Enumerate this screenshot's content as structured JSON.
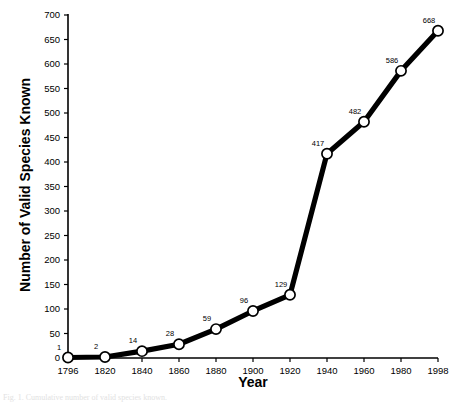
{
  "chart_data": {
    "type": "line",
    "title": "",
    "xlabel": "Year",
    "ylabel": "Number of Valid Species Known",
    "x": [
      1796,
      1820,
      1840,
      1860,
      1880,
      1900,
      1920,
      1940,
      1960,
      1980,
      1998
    ],
    "values": [
      1,
      2,
      14,
      28,
      59,
      96,
      129,
      417,
      482,
      586,
      668
    ],
    "point_labels": [
      "1",
      "2",
      "14",
      "28",
      "59",
      "96",
      "129",
      "417",
      "482",
      "586",
      "668"
    ],
    "xtick_labels": [
      "1796",
      "1820",
      "1840",
      "1860",
      "1880",
      "1900",
      "1920",
      "1940",
      "1960",
      "1980",
      "1998"
    ],
    "ytick_values": [
      0,
      50,
      100,
      150,
      200,
      250,
      300,
      350,
      400,
      450,
      500,
      550,
      600,
      650,
      700
    ],
    "ytick_labels": [
      "0",
      "50",
      "100",
      "150",
      "200",
      "250",
      "300",
      "350",
      "400",
      "450",
      "500",
      "550",
      "600",
      "650",
      "700"
    ],
    "ylim": [
      0,
      700
    ],
    "xlim": [
      1796,
      1998
    ],
    "grid": false,
    "legend": false,
    "line_color": "#000000",
    "marker_face_color": "#ffffff",
    "marker_edge_color": "#000000",
    "axis_color": "#000000"
  },
  "caption": "Fig. 1. Cumulative number of valid species known."
}
